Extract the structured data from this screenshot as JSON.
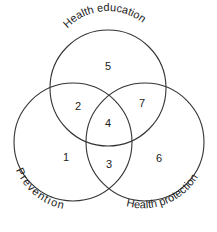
{
  "diagram": {
    "type": "venn",
    "sets": [
      {
        "id": "health_education",
        "label": "Health education",
        "cx": 108,
        "cy": 88,
        "r": 58
      },
      {
        "id": "prevention",
        "label": "Prevention",
        "cx": 73,
        "cy": 142,
        "r": 59
      },
      {
        "id": "health_protection",
        "label": "Health protection",
        "cx": 145,
        "cy": 142,
        "r": 59
      }
    ],
    "regions": [
      {
        "label": "1",
        "sets": [
          "prevention"
        ],
        "x": 66,
        "y": 158
      },
      {
        "label": "2",
        "sets": [
          "prevention",
          "health_education"
        ],
        "x": 78,
        "y": 107
      },
      {
        "label": "3",
        "sets": [
          "prevention",
          "health_protection"
        ],
        "x": 109,
        "y": 165
      },
      {
        "label": "4",
        "sets": [
          "prevention",
          "health_education",
          "health_protection"
        ],
        "x": 108,
        "y": 124
      },
      {
        "label": "5",
        "sets": [
          "health_education"
        ],
        "x": 108,
        "y": 67
      },
      {
        "label": "6",
        "sets": [
          "health_protection"
        ],
        "x": 159,
        "y": 159
      },
      {
        "label": "7",
        "sets": [
          "health_education",
          "health_protection"
        ],
        "x": 142,
        "y": 104
      }
    ]
  }
}
